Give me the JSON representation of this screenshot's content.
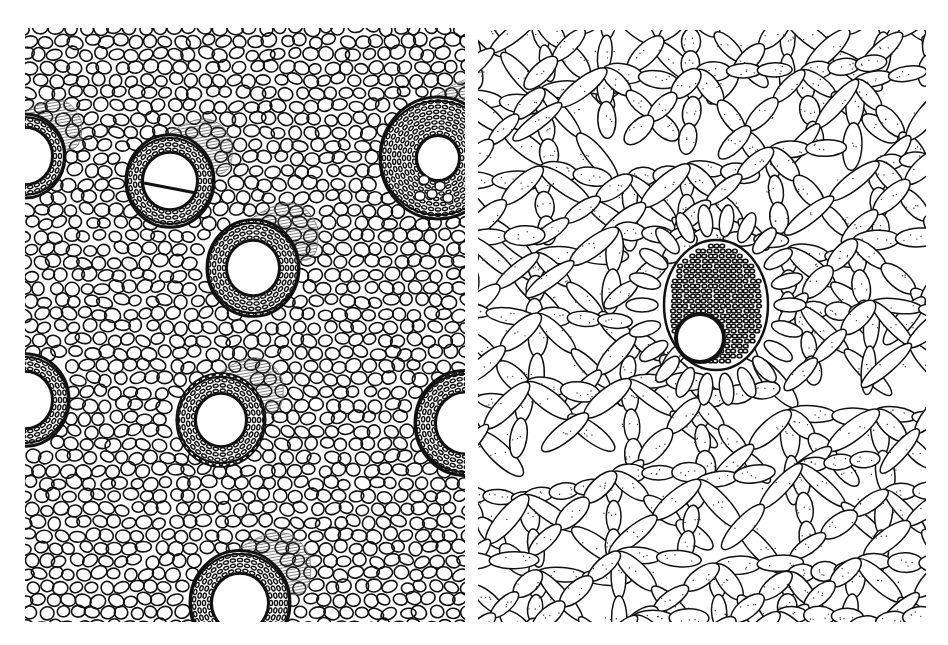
{
  "figure": {
    "colors": {
      "ink": "#111111",
      "paper": "#ffffff",
      "hatch": "#555555"
    },
    "panels": [
      {
        "id": "left",
        "subject": "Ground parenchyma with scattered vascular bundles",
        "bounds": {
          "x": 25,
          "y": 28,
          "w": 440,
          "h": 594
        },
        "bundles": [
          {
            "cx": 0,
            "cy": 128,
            "r": 40,
            "vessel_r": 26,
            "cap": true
          },
          {
            "cx": 145,
            "cy": 153,
            "r": 44,
            "vessel_r": 26,
            "cap": true,
            "divided_vessel": true
          },
          {
            "cx": 228,
            "cy": 240,
            "r": 46,
            "vessel_r": 25,
            "cap": true
          },
          {
            "cx": 413,
            "cy": 130,
            "r": 58,
            "vessel_r": 20,
            "cap": true,
            "small_vessels": 5
          },
          {
            "cx": 0,
            "cy": 372,
            "r": 44,
            "vessel_r": 26,
            "cap": false
          },
          {
            "cx": 196,
            "cy": 392,
            "r": 44,
            "vessel_r": 24,
            "cap": true
          },
          {
            "cx": 440,
            "cy": 395,
            "r": 50,
            "vessel_r": 28,
            "cap": false
          },
          {
            "cx": 215,
            "cy": 575,
            "r": 50,
            "vessel_r": 27,
            "cap": true
          }
        ]
      },
      {
        "id": "right",
        "subject": "Aerenchyma network with a single central vascular bundle",
        "bounds": {
          "x": 478,
          "y": 30,
          "w": 448,
          "h": 592
        },
        "bundle": {
          "cx": 238,
          "cy": 275,
          "rx": 52,
          "ry": 65,
          "vessel_cx": 222,
          "vessel_cy": 308,
          "vessel_r": 22
        }
      }
    ]
  }
}
